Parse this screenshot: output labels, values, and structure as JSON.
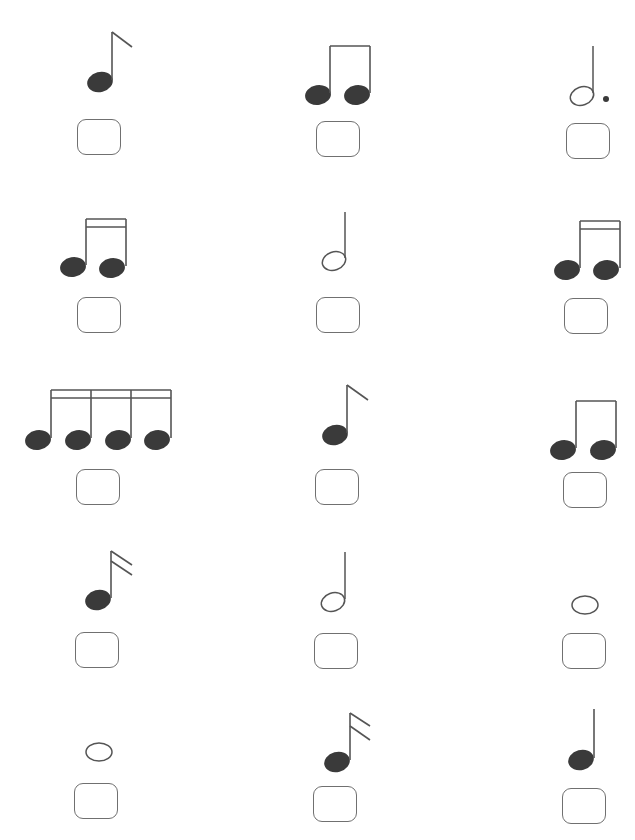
{
  "worksheet": {
    "colors": {
      "ink": "#3a3a3a",
      "stroke": "#555555",
      "box_border": "#707070",
      "background": "#ffffff"
    },
    "items": [
      {
        "row": 1,
        "col": 1,
        "note": "eighth-note",
        "answer": ""
      },
      {
        "row": 1,
        "col": 2,
        "note": "beamed-eighth-pair",
        "answer": ""
      },
      {
        "row": 1,
        "col": 3,
        "note": "dotted-half-note",
        "answer": ""
      },
      {
        "row": 2,
        "col": 1,
        "note": "beamed-sixteenth-pair",
        "answer": ""
      },
      {
        "row": 2,
        "col": 2,
        "note": "half-note",
        "answer": ""
      },
      {
        "row": 2,
        "col": 3,
        "note": "beamed-sixteenth-pair",
        "answer": ""
      },
      {
        "row": 3,
        "col": 1,
        "note": "beamed-sixteenth-group-of-four",
        "answer": ""
      },
      {
        "row": 3,
        "col": 2,
        "note": "eighth-note",
        "answer": ""
      },
      {
        "row": 3,
        "col": 3,
        "note": "beamed-eighth-pair",
        "answer": ""
      },
      {
        "row": 4,
        "col": 1,
        "note": "sixteenth-note",
        "answer": ""
      },
      {
        "row": 4,
        "col": 2,
        "note": "half-note",
        "answer": ""
      },
      {
        "row": 4,
        "col": 3,
        "note": "whole-note",
        "answer": ""
      },
      {
        "row": 5,
        "col": 1,
        "note": "whole-note",
        "answer": ""
      },
      {
        "row": 5,
        "col": 2,
        "note": "sixteenth-note",
        "answer": ""
      },
      {
        "row": 5,
        "col": 3,
        "note": "quarter-note",
        "answer": ""
      }
    ]
  }
}
